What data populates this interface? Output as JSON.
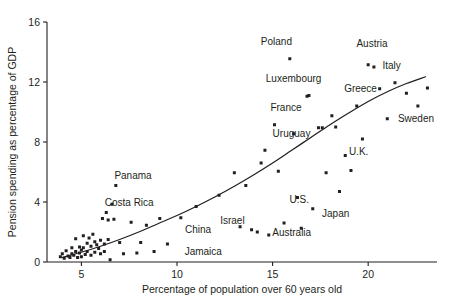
{
  "chart_data": {
    "type": "scatter",
    "title": "",
    "xlabel": "Percentage of population over 60 years old",
    "ylabel": "Pension spending as percentage of GDP",
    "xlim": [
      3.2,
      23.6
    ],
    "ylim": [
      0,
      16
    ],
    "xticks": [
      5,
      10,
      15,
      20
    ],
    "yticks": [
      0,
      4,
      8,
      12,
      16
    ],
    "grid": false,
    "legend": "none",
    "series": [
      {
        "name": "Countries",
        "marker": "square",
        "color": "#231f20",
        "points": [
          {
            "x": 3.9,
            "y": 0.35
          },
          {
            "x": 4.0,
            "y": 0.55
          },
          {
            "x": 4.1,
            "y": 0.25
          },
          {
            "x": 4.2,
            "y": 0.75
          },
          {
            "x": 4.3,
            "y": 0.4
          },
          {
            "x": 4.4,
            "y": 0.3
          },
          {
            "x": 4.5,
            "y": 0.95
          },
          {
            "x": 4.5,
            "y": 0.55
          },
          {
            "x": 4.6,
            "y": 0.45
          },
          {
            "x": 4.7,
            "y": 1.55
          },
          {
            "x": 4.7,
            "y": 0.7
          },
          {
            "x": 4.8,
            "y": 0.3
          },
          {
            "x": 4.9,
            "y": 1.0
          },
          {
            "x": 4.9,
            "y": 0.6
          },
          {
            "x": 5.0,
            "y": 0.8
          },
          {
            "x": 5.0,
            "y": 0.35
          },
          {
            "x": 5.1,
            "y": 1.75
          },
          {
            "x": 5.1,
            "y": 0.95
          },
          {
            "x": 5.2,
            "y": 0.5
          },
          {
            "x": 5.3,
            "y": 1.25
          },
          {
            "x": 5.3,
            "y": 0.7
          },
          {
            "x": 5.4,
            "y": 1.6
          },
          {
            "x": 5.5,
            "y": 1.05
          },
          {
            "x": 5.5,
            "y": 0.45
          },
          {
            "x": 5.6,
            "y": 1.85
          },
          {
            "x": 5.7,
            "y": 1.35
          },
          {
            "x": 5.7,
            "y": 0.65
          },
          {
            "x": 5.8,
            "y": 1.15
          },
          {
            "x": 5.9,
            "y": 0.9
          },
          {
            "x": 6.0,
            "y": 1.45
          },
          {
            "x": 6.0,
            "y": 0.55
          },
          {
            "x": 6.1,
            "y": 2.9
          },
          {
            "x": 6.2,
            "y": 1.2
          },
          {
            "x": 6.2,
            "y": 0.7
          },
          {
            "x": 6.3,
            "y": 3.3
          },
          {
            "x": 6.4,
            "y": 2.8
          },
          {
            "x": 6.4,
            "y": 1.5
          },
          {
            "x": 6.5,
            "y": 0.15
          },
          {
            "x": 6.6,
            "y": 3.85
          },
          {
            "x": 6.7,
            "y": 2.85
          },
          {
            "x": 6.8,
            "y": 5.1
          },
          {
            "x": 7.0,
            "y": 1.3
          },
          {
            "x": 7.2,
            "y": 0.55
          },
          {
            "x": 7.6,
            "y": 2.65
          },
          {
            "x": 7.9,
            "y": 0.6
          },
          {
            "x": 8.1,
            "y": 1.3
          },
          {
            "x": 8.4,
            "y": 2.45
          },
          {
            "x": 8.8,
            "y": 0.7
          },
          {
            "x": 9.1,
            "y": 2.9
          },
          {
            "x": 9.5,
            "y": 1.2
          },
          {
            "x": 10.2,
            "y": 2.95
          },
          {
            "x": 11.0,
            "y": 3.7
          },
          {
            "x": 12.2,
            "y": 4.45
          },
          {
            "x": 13.0,
            "y": 5.95
          },
          {
            "x": 13.3,
            "y": 2.35
          },
          {
            "x": 13.6,
            "y": 5.1
          },
          {
            "x": 13.9,
            "y": 2.15
          },
          {
            "x": 14.2,
            "y": 2.0
          },
          {
            "x": 14.4,
            "y": 6.6
          },
          {
            "x": 14.6,
            "y": 7.45
          },
          {
            "x": 14.8,
            "y": 1.8
          },
          {
            "x": 15.1,
            "y": 9.15
          },
          {
            "x": 15.3,
            "y": 6.05
          },
          {
            "x": 15.6,
            "y": 2.6
          },
          {
            "x": 15.9,
            "y": 13.55
          },
          {
            "x": 16.1,
            "y": 8.55
          },
          {
            "x": 16.3,
            "y": 4.3
          },
          {
            "x": 16.5,
            "y": 2.25
          },
          {
            "x": 16.8,
            "y": 11.05
          },
          {
            "x": 16.9,
            "y": 11.1
          },
          {
            "x": 17.1,
            "y": 3.55
          },
          {
            "x": 17.4,
            "y": 8.95
          },
          {
            "x": 17.6,
            "y": 8.95
          },
          {
            "x": 17.8,
            "y": 5.95
          },
          {
            "x": 18.1,
            "y": 9.75
          },
          {
            "x": 18.3,
            "y": 9.0
          },
          {
            "x": 18.5,
            "y": 4.7
          },
          {
            "x": 18.8,
            "y": 7.1
          },
          {
            "x": 19.1,
            "y": 6.1
          },
          {
            "x": 19.4,
            "y": 10.4
          },
          {
            "x": 19.7,
            "y": 8.2
          },
          {
            "x": 20.0,
            "y": 13.15
          },
          {
            "x": 20.3,
            "y": 13.0
          },
          {
            "x": 20.6,
            "y": 11.55
          },
          {
            "x": 21.0,
            "y": 9.55
          },
          {
            "x": 21.4,
            "y": 11.95
          },
          {
            "x": 22.0,
            "y": 11.25
          },
          {
            "x": 22.6,
            "y": 10.4
          },
          {
            "x": 23.1,
            "y": 11.6
          }
        ]
      }
    ],
    "trend_curve": {
      "label": "fitted trend",
      "points": [
        {
          "x": 4.0,
          "y": 0.3
        },
        {
          "x": 5.0,
          "y": 0.65
        },
        {
          "x": 6.0,
          "y": 1.05
        },
        {
          "x": 7.0,
          "y": 1.5
        },
        {
          "x": 8.0,
          "y": 2.0
        },
        {
          "x": 9.0,
          "y": 2.55
        },
        {
          "x": 10.0,
          "y": 3.1
        },
        {
          "x": 11.0,
          "y": 3.7
        },
        {
          "x": 12.0,
          "y": 4.35
        },
        {
          "x": 13.0,
          "y": 5.05
        },
        {
          "x": 14.0,
          "y": 5.8
        },
        {
          "x": 15.0,
          "y": 6.6
        },
        {
          "x": 16.0,
          "y": 7.45
        },
        {
          "x": 17.0,
          "y": 8.3
        },
        {
          "x": 18.0,
          "y": 9.15
        },
        {
          "x": 19.0,
          "y": 9.95
        },
        {
          "x": 20.0,
          "y": 10.7
        },
        {
          "x": 21.0,
          "y": 11.35
        },
        {
          "x": 22.0,
          "y": 11.9
        },
        {
          "x": 23.0,
          "y": 12.35
        }
      ]
    },
    "annotations": [
      {
        "text": "Poland",
        "x": 15.9,
        "y": 13.55,
        "lx": 15.2,
        "ly": 14.7,
        "anchor": "middle"
      },
      {
        "text": "Austria",
        "x": 20.0,
        "y": 13.15,
        "lx": 20.2,
        "ly": 14.55,
        "anchor": "middle"
      },
      {
        "text": "Italy",
        "x": 20.3,
        "y": 13.0,
        "lx": 20.75,
        "ly": 13.1,
        "anchor": "start"
      },
      {
        "text": "Luxembourg",
        "x": 16.9,
        "y": 11.1,
        "lx": 16.1,
        "ly": 12.25,
        "anchor": "middle"
      },
      {
        "text": "Greece",
        "x": 19.4,
        "y": 10.4,
        "lx": 19.6,
        "ly": 11.6,
        "anchor": "middle"
      },
      {
        "text": "Sweden",
        "x": 22.6,
        "y": 10.4,
        "lx": 22.5,
        "ly": 9.6,
        "anchor": "middle"
      },
      {
        "text": "France",
        "x": 16.1,
        "y": 8.55,
        "lx": 15.7,
        "ly": 10.3,
        "anchor": "middle"
      },
      {
        "text": "Uruguay",
        "x": 15.1,
        "y": 9.15,
        "lx": 15.0,
        "ly": 8.55,
        "anchor": "start"
      },
      {
        "text": "U.K.",
        "x": 19.1,
        "y": 6.1,
        "lx": 19.5,
        "ly": 7.35,
        "anchor": "middle"
      },
      {
        "text": "U.S.",
        "x": 16.5,
        "y": 4.3,
        "lx": 16.4,
        "ly": 4.15,
        "anchor": "middle"
      },
      {
        "text": "Japan",
        "x": 18.5,
        "y": 3.55,
        "lx": 18.3,
        "ly": 3.25,
        "anchor": "middle"
      },
      {
        "text": "Australia",
        "x": 16.3,
        "y": 2.25,
        "lx": 16.0,
        "ly": 2.0,
        "anchor": "middle"
      },
      {
        "text": "Israel",
        "x": 13.0,
        "y": 2.95,
        "lx": 12.9,
        "ly": 2.75,
        "anchor": "middle"
      },
      {
        "text": "Panama",
        "x": 6.8,
        "y": 5.1,
        "lx": 7.7,
        "ly": 5.75,
        "anchor": "middle"
      },
      {
        "text": "Costa Rica",
        "x": 6.6,
        "y": 3.85,
        "lx": 7.5,
        "ly": 4.0,
        "anchor": "middle"
      },
      {
        "text": "China",
        "x": 9.5,
        "y": 1.2,
        "lx": 11.1,
        "ly": 2.2,
        "anchor": "middle"
      },
      {
        "text": "Jamaica",
        "x": 8.8,
        "y": 0.7,
        "lx": 10.4,
        "ly": 0.7,
        "anchor": "start"
      }
    ]
  }
}
